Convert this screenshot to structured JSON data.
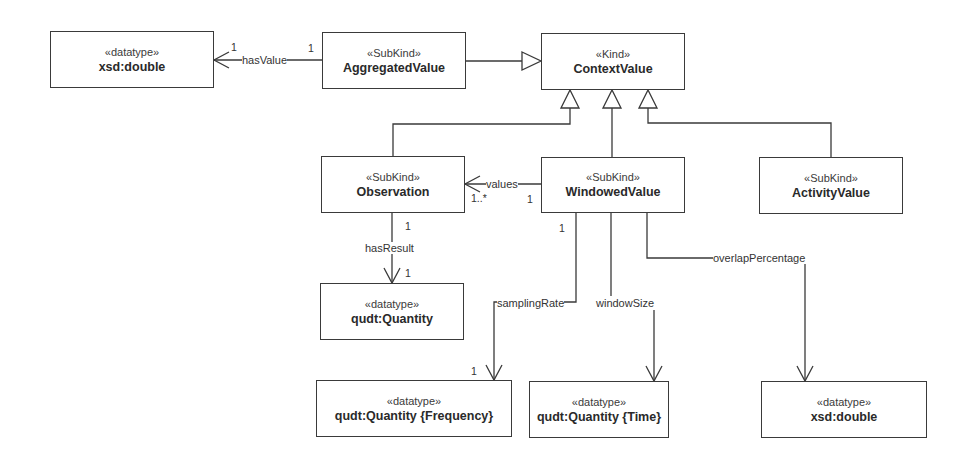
{
  "diagram": {
    "type": "UML class diagram",
    "classes": [
      {
        "id": "xsd_double_top",
        "stereotype": "«datatype»",
        "name": "xsd:double"
      },
      {
        "id": "aggregated_value",
        "stereotype": "«SubKind»",
        "name": "AggregatedValue"
      },
      {
        "id": "context_value",
        "stereotype": "«Kind»",
        "name": "ContextValue"
      },
      {
        "id": "observation",
        "stereotype": "«SubKind»",
        "name": "Observation"
      },
      {
        "id": "windowed_value",
        "stereotype": "«SubKind»",
        "name": "WindowedValue"
      },
      {
        "id": "activity_value",
        "stereotype": "«SubKind»",
        "name": "ActivityValue"
      },
      {
        "id": "qudt_quantity",
        "stereotype": "«datatype»",
        "name": "qudt:Quantity"
      },
      {
        "id": "qudt_quantity_frequency",
        "stereotype": "«datatype»",
        "name": "qudt:Quantity {Frequency}"
      },
      {
        "id": "qudt_quantity_time",
        "stereotype": "«datatype»",
        "name": "qudt:Quantity {Time}"
      },
      {
        "id": "xsd_double_bottom",
        "stereotype": "«datatype»",
        "name": "xsd:double"
      }
    ],
    "associations": [
      {
        "label": "hasValue",
        "from": "AggregatedValue",
        "to": "xsd:double",
        "source_mult": "1",
        "target_mult": "1"
      },
      {
        "label": "values",
        "from": "WindowedValue",
        "to": "Observation",
        "source_mult": "1",
        "target_mult": "1..*"
      },
      {
        "label": "hasResult",
        "from": "Observation",
        "to": "qudt:Quantity",
        "source_mult": "1",
        "target_mult": "1"
      },
      {
        "label": "samplingRate",
        "from": "WindowedValue",
        "to": "qudt:Quantity {Frequency}",
        "source_mult": "1",
        "target_mult": "1"
      },
      {
        "label": "windowSize",
        "from": "WindowedValue",
        "to": "qudt:Quantity {Time}"
      },
      {
        "label": "overlapPercentage",
        "from": "WindowedValue",
        "to": "xsd:double"
      }
    ],
    "generalizations": [
      {
        "child": "AggregatedValue",
        "parent": "ContextValue"
      },
      {
        "child": "Observation",
        "parent": "ContextValue"
      },
      {
        "child": "WindowedValue",
        "parent": "ContextValue"
      },
      {
        "child": "ActivityValue",
        "parent": "ContextValue"
      }
    ],
    "colors": {
      "line": "#3a3a3a",
      "background": "#ffffff",
      "text": "#2a2a2a"
    }
  }
}
